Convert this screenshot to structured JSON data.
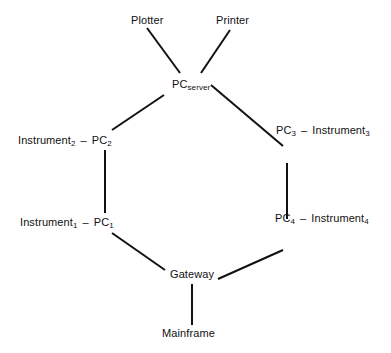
{
  "diagram": {
    "type": "ring-network",
    "line_color": "#111111",
    "nodes": {
      "plotter": {
        "label": "Plotter"
      },
      "printer": {
        "label": "Printer"
      },
      "pc_server": {
        "base": "PC",
        "sub": "server"
      },
      "pc2": {
        "base": "PC",
        "sub": "2",
        "instrument_base": "Instrument",
        "instrument_sub": "2"
      },
      "pc3": {
        "base": "PC",
        "sub": "3",
        "instrument_base": "Instrument",
        "instrument_sub": "3"
      },
      "pc1": {
        "base": "PC",
        "sub": "1",
        "instrument_base": "Instrument",
        "instrument_sub": "1"
      },
      "pc4": {
        "base": "PC",
        "sub": "4",
        "instrument_base": "Instrument",
        "instrument_sub": "4"
      },
      "gateway": {
        "label": "Gateway"
      },
      "mainframe": {
        "label": "Mainframe"
      }
    },
    "separator": "–",
    "edges": [
      [
        "Plotter",
        "PC_server"
      ],
      [
        "Printer",
        "PC_server"
      ],
      [
        "PC_server",
        "PC_2"
      ],
      [
        "PC_server",
        "PC_3"
      ],
      [
        "PC_2",
        "PC_1"
      ],
      [
        "PC_3",
        "PC_4"
      ],
      [
        "PC_1",
        "Gateway"
      ],
      [
        "PC_4",
        "Gateway"
      ],
      [
        "Gateway",
        "Mainframe"
      ],
      [
        "Instrument_1",
        "PC_1"
      ],
      [
        "Instrument_2",
        "PC_2"
      ],
      [
        "Instrument_3",
        "PC_3"
      ],
      [
        "Instrument_4",
        "PC_4"
      ]
    ]
  }
}
